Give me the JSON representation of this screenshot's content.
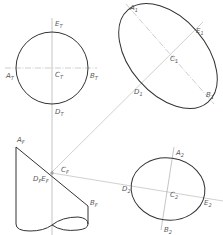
{
  "diagram": {
    "type": "descriptive-geometry-projection",
    "views": {
      "top_view": {
        "labels": {
          "E": "E",
          "E_sub": "T",
          "A": "A",
          "A_sub": "T",
          "B": "B",
          "B_sub": "T",
          "C": "C",
          "C_sub": "T",
          "D": "D",
          "D_sub": "T"
        }
      },
      "auxiliary_view_1": {
        "labels": {
          "A": "A",
          "A_sub": "1",
          "E": "E",
          "E_sub": "1",
          "C": "C",
          "C_sub": "1",
          "D": "D",
          "D_sub": "1",
          "B": "B",
          "B_sub": "1"
        }
      },
      "front_view": {
        "labels": {
          "A": "A",
          "A_sub": "F",
          "B": "B",
          "B_sub": "F",
          "C": "C",
          "C_sub": "F",
          "DE": "D",
          "DE_sub1": "F",
          "DE_mid": "E",
          "DE_sub2": "F"
        }
      },
      "auxiliary_view_2": {
        "labels": {
          "A": "A",
          "A_sub": "2",
          "B": "B",
          "B_sub": "2",
          "C": "C",
          "C_sub": "2",
          "D": "D",
          "D_sub": "2",
          "E": "E",
          "E_sub": "2"
        }
      }
    },
    "colors": {
      "outline": "#333333",
      "construction": "#9a9a9a",
      "label": "#555555",
      "background": "#ffffff"
    }
  }
}
